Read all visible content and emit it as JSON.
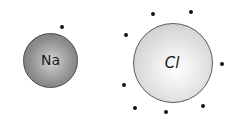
{
  "diagram": {
    "type": "lewis-dot-structure",
    "background_color": "#ffffff",
    "width": 241,
    "height": 127,
    "atoms": [
      {
        "id": "na",
        "label": "Na",
        "element": "sodium",
        "cx": 50.5,
        "cy": 60.5,
        "r": 27.5,
        "fill_center": "#d8d8d8",
        "fill_edge": "#757575",
        "stroke": "#4a4a4a",
        "valence_electron_count": 1
      },
      {
        "id": "cl",
        "label": "Cl",
        "element": "chlorine",
        "cx": 173,
        "cy": 63,
        "r": 40,
        "fill_center": "#ffffff",
        "fill_edge": "#c2c2c2",
        "stroke": "#5a5a5a",
        "valence_electron_count": 7
      }
    ],
    "electrons": [
      {
        "atom": "na",
        "x": 62,
        "y": 27
      },
      {
        "atom": "cl",
        "x": 153,
        "y": 14
      },
      {
        "atom": "cl",
        "x": 191,
        "y": 12
      },
      {
        "atom": "cl",
        "x": 126,
        "y": 35
      },
      {
        "atom": "cl",
        "x": 222,
        "y": 64
      },
      {
        "atom": "cl",
        "x": 124,
        "y": 85
      },
      {
        "atom": "cl",
        "x": 166,
        "y": 112
      },
      {
        "atom": "cl",
        "x": 203,
        "y": 106
      },
      {
        "atom": "cl",
        "x": 135,
        "y": 108
      }
    ],
    "electron_color": "#151515",
    "electron_size": 4
  }
}
